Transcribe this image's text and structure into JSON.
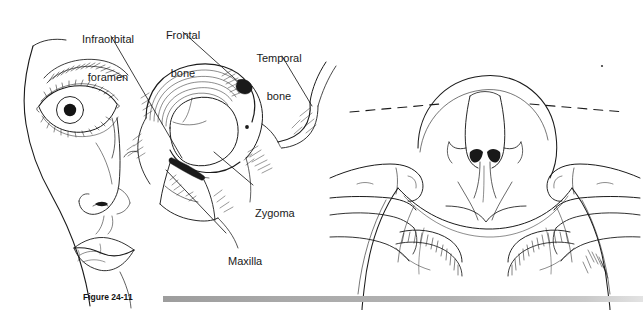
{
  "figure": {
    "caption_number": "Figure 24-11",
    "caption_bar_color": "#a9a9a9",
    "background_color": "#ffffff",
    "ink_color": "#1b1b1b"
  },
  "panels": {
    "left": {
      "name": "oblique-facial-view",
      "description": "Oblique view of face with underlying facial skeleton exposed on the patient's right side"
    },
    "right": {
      "name": "vertex-view",
      "description": "View looking down over the patient's head from above, examiner's fingers palpating both zygomatic arches, with dashed symmetry reference line"
    }
  },
  "labels": [
    {
      "id": "infraorbital-foramen",
      "line1": "Infraorbital",
      "line2": "foramen",
      "x": 74,
      "y": 8
    },
    {
      "id": "frontal-bone",
      "line1": "Frontal",
      "line2": "bone",
      "x": 160,
      "y": 4
    },
    {
      "id": "temporal-bone",
      "line1": "Temporal",
      "line2": "bone",
      "x": 252,
      "y": 27
    },
    {
      "id": "zygoma",
      "line1": "Zygoma",
      "line2": "",
      "x": 257,
      "y": 182
    },
    {
      "id": "maxilla",
      "line1": "Maxilla",
      "line2": "",
      "x": 230,
      "y": 230
    }
  ]
}
